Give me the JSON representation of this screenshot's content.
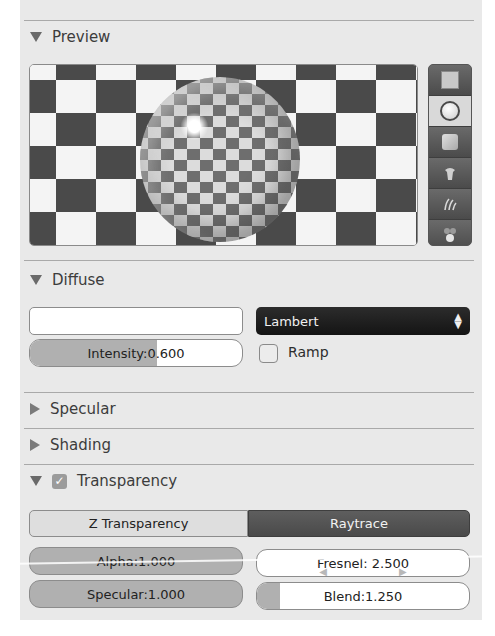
{
  "panels": {
    "preview": {
      "label": "Preview",
      "expanded": true
    },
    "diffuse": {
      "label": "Diffuse",
      "expanded": true
    },
    "specular": {
      "label": "Specular",
      "expanded": false
    },
    "shading": {
      "label": "Shading",
      "expanded": false
    },
    "transparency": {
      "label": "Transparency",
      "expanded": true,
      "enabled": true,
      "check_glyph": "✓"
    }
  },
  "preview": {
    "tools": [
      {
        "name": "flat-plane",
        "icon": "plane-icon",
        "active": false
      },
      {
        "name": "sphere",
        "icon": "sphere-icon",
        "active": true
      },
      {
        "name": "cube",
        "icon": "cube-icon",
        "active": false
      },
      {
        "name": "monkey",
        "icon": "monkey-icon",
        "active": false
      },
      {
        "name": "hair",
        "icon": "hair-strands-icon",
        "active": false
      },
      {
        "name": "sphere-atmosphere",
        "icon": "world-spheres-icon",
        "active": false
      }
    ]
  },
  "diffuse": {
    "color_value": "",
    "shader": "Lambert",
    "shader_arrows": "⬍",
    "intensity_label": "Intensity:0.600",
    "intensity": 0.6,
    "ramp_label": "Ramp",
    "ramp_checked": false
  },
  "transparency": {
    "modes": [
      {
        "label": "Z Transparency",
        "active": false
      },
      {
        "label": "Raytrace",
        "active": true
      }
    ],
    "alpha_label": "Alpha:1.000",
    "alpha": 1.0,
    "specular_label": "Specular:1.000",
    "specular": 1.0,
    "fresnel_label": "Fresnel: 2.500",
    "fresnel": 2.5,
    "blend_label": "Blend:1.250",
    "blend": 1.25,
    "arrow_left": "◀",
    "arrow_right": "▶"
  },
  "colors": {
    "panel_bg": "#e9e9e9",
    "slider_fill": "#b0b0b0",
    "active_tab": "#545454",
    "dropdown_bg": "#1c1c1c"
  }
}
